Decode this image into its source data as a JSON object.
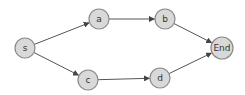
{
  "diagram": {
    "type": "directed-graph",
    "style": {
      "node_fill": "#d9d9d9",
      "node_stroke": "#8a8a8a",
      "edge_color": "#555555"
    },
    "nodes": [
      {
        "id": "s",
        "label": "s",
        "x": 25,
        "y": 48,
        "r": 10
      },
      {
        "id": "a",
        "label": "a",
        "x": 99,
        "y": 19,
        "r": 10
      },
      {
        "id": "b",
        "label": "b",
        "x": 165,
        "y": 19,
        "r": 10
      },
      {
        "id": "c",
        "label": "c",
        "x": 88,
        "y": 80,
        "r": 10
      },
      {
        "id": "d",
        "label": "d",
        "x": 160,
        "y": 78,
        "r": 10
      },
      {
        "id": "end",
        "label": "End",
        "x": 222,
        "y": 48,
        "r": 11
      }
    ],
    "edges": [
      {
        "from": "s",
        "to": "a"
      },
      {
        "from": "a",
        "to": "b"
      },
      {
        "from": "b",
        "to": "end"
      },
      {
        "from": "s",
        "to": "c"
      },
      {
        "from": "c",
        "to": "d"
      },
      {
        "from": "d",
        "to": "end"
      }
    ]
  }
}
